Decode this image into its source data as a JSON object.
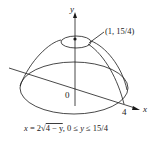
{
  "figure": {
    "axis_labels": {
      "y": "y",
      "x": "x"
    },
    "origin_label": "0",
    "x_tick_label": "4",
    "point_label": "(1, 15/4)",
    "caption": {
      "lhs": "x",
      "eq": " = 2",
      "radicand": "4 − y",
      "rest": ", 0 ≤ ",
      "var": "y",
      "tail": " ≤ 15/4"
    }
  },
  "colors": {
    "stroke": "#1a1a1a",
    "background": "#ffffff"
  }
}
